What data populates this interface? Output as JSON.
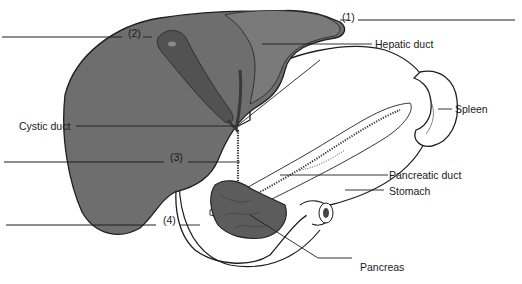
{
  "diagram": {
    "labels": {
      "num1": "(1)",
      "num2": "(2)",
      "num3": "(3)",
      "num4": "(4)",
      "hepatic_duct": "Hepatic duct",
      "cystic_duct": "Cystic duct",
      "spleen": "Spleen",
      "pancreatic_duct": "Pancreatic duct",
      "stomach": "Stomach",
      "pancreas": "Pancreas"
    },
    "blanks": [
      {
        "id": "1",
        "answer_line": ""
      },
      {
        "id": "2",
        "answer_line": ""
      },
      {
        "id": "3",
        "answer_line": ""
      },
      {
        "id": "4",
        "answer_line": ""
      }
    ],
    "colors": {
      "liver": "#6e6e6e",
      "gallbladder": "#565656",
      "pancreas": "#5c5c5c",
      "outline": "#1e1e1e",
      "background": "#ffffff"
    }
  }
}
